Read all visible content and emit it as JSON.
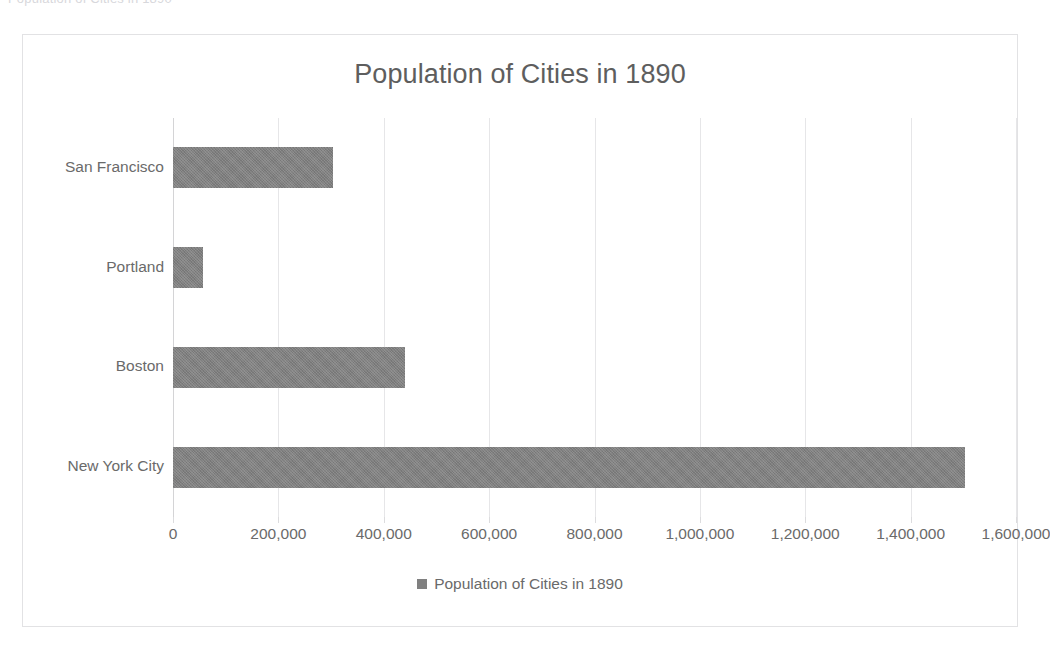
{
  "page": {
    "top_fragment": "Population of Cities in 1890"
  },
  "chart_data": {
    "type": "bar",
    "orientation": "horizontal",
    "title": "Population of Cities in 1890",
    "xlabel": "",
    "ylabel": "",
    "categories": [
      "San Francisco",
      "Portland",
      "Boston",
      "New York City"
    ],
    "values": [
      303000,
      57000,
      441000,
      1503000
    ],
    "series": [
      {
        "name": "Population of Cities in 1890",
        "values": [
          303000,
          57000,
          441000,
          1503000
        ]
      }
    ],
    "xlim": [
      0,
      1600000
    ],
    "xticks": [
      0,
      200000,
      400000,
      600000,
      800000,
      1000000,
      1200000,
      1400000,
      1600000
    ],
    "xtick_labels": [
      "0",
      "200,000",
      "400,000",
      "600,000",
      "800,000",
      "1,000,000",
      "1,200,000",
      "1,400,000",
      "1,600,000"
    ],
    "grid": "vertical",
    "legend": {
      "position": "bottom",
      "entries": [
        "Population of Cities in 1890"
      ]
    },
    "colors": {
      "bar": "#808080",
      "gridline": "#e6e6e8",
      "axis": "#d4d4d6",
      "title_text": "#5e5e5e",
      "label_text": "#6a6a6a",
      "frame_border": "#e2e2e4",
      "background": "#ffffff"
    }
  }
}
